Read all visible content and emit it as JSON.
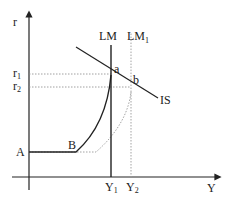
{
  "diagram": {
    "axes": {
      "y_label": "r",
      "x_label": "Y"
    },
    "curves": {
      "lm": {
        "label": "LM",
        "style": "solid"
      },
      "lm1": {
        "label": "LM",
        "subscript": "1",
        "style": "dotted"
      },
      "is": {
        "label": "IS",
        "style": "solid"
      }
    },
    "points": {
      "a": "a",
      "b": "b",
      "A": "A",
      "B": "B"
    },
    "y_ticks": [
      {
        "label": "r",
        "subscript": "1"
      },
      {
        "label": "r",
        "subscript": "2"
      }
    ],
    "x_ticks": [
      {
        "label": "Y",
        "subscript": "1"
      },
      {
        "label": "Y",
        "subscript": "2"
      }
    ],
    "colors": {
      "line": "#222222",
      "dotted": "#888888",
      "background": "#ffffff"
    }
  }
}
